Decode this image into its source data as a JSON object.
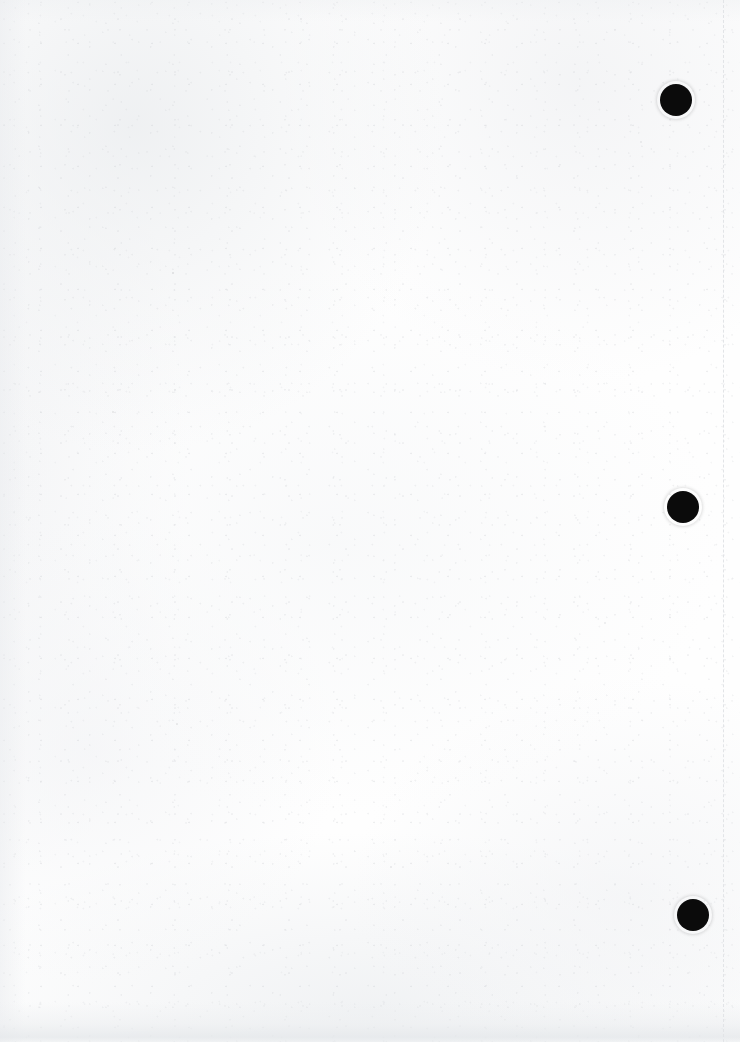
{
  "document": {
    "kind": "scanned-blank-page",
    "page_label": "",
    "width": 740,
    "height": 1042,
    "paper_color": "#fefefe",
    "background_color": "#ffffff",
    "visible_text": "",
    "body_text": ""
  },
  "perforation": {
    "name": "tear-line",
    "orientation": "vertical",
    "x": 723,
    "top": 0,
    "bottom": 1042,
    "color": "#e2e4e7",
    "thickness": 1,
    "dash_length": 11,
    "gap_length": 10
  },
  "marks": {
    "label": "registration dots",
    "color": "#0b0b0b",
    "diameter": 32,
    "items": [
      {
        "name": "registration-dot-top",
        "cx": 676,
        "cy": 100,
        "r": 16
      },
      {
        "name": "registration-dot-middle",
        "cx": 683,
        "cy": 507,
        "r": 16
      },
      {
        "name": "registration-dot-bottom",
        "cx": 693,
        "cy": 915,
        "r": 16
      }
    ]
  },
  "specks": [
    {
      "name": "speck-upper-left",
      "x": 172,
      "y": 272,
      "size": 2.0,
      "opacity": 0.5
    },
    {
      "name": "speck-mid-left",
      "x": 112,
      "y": 411,
      "size": 1.6,
      "opacity": 0.35
    },
    {
      "name": "speck-mid-right",
      "x": 604,
      "y": 622,
      "size": 1.8,
      "opacity": 0.32
    },
    {
      "name": "speck-lower-left",
      "x": 176,
      "y": 723,
      "size": 1.7,
      "opacity": 0.34
    },
    {
      "name": "speck-lower-mid",
      "x": 390,
      "y": 866,
      "size": 1.5,
      "opacity": 0.3
    },
    {
      "name": "speck-upper-right",
      "x": 640,
      "y": 141,
      "size": 1.6,
      "opacity": 0.3
    },
    {
      "name": "speck-top-mid",
      "x": 300,
      "y": 18,
      "size": 1.5,
      "opacity": 0.28
    }
  ],
  "edges": {
    "bottom_shadow_height": 40,
    "left_shadow_width": 26,
    "top_shadow_height": 22
  }
}
